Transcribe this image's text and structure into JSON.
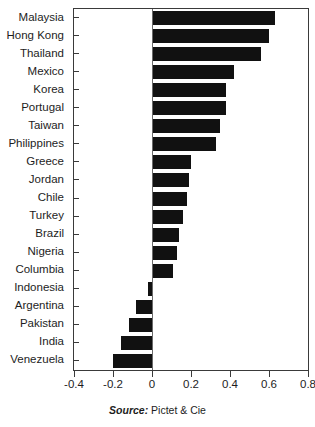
{
  "chart_data": {
    "type": "bar",
    "orientation": "horizontal",
    "title": "",
    "subtitle": "",
    "xlabel": "",
    "ylabel": "",
    "xlim": [
      -0.4,
      0.8
    ],
    "xticks": [
      -0.4,
      -0.2,
      0,
      0.2,
      0.4,
      0.6,
      0.8
    ],
    "xticklabels": [
      "-0.4",
      "-0.2",
      "0",
      "0.2",
      "0.4",
      "0.6",
      "0.8"
    ],
    "grid": false,
    "legend": null,
    "zero_line": true,
    "bar_color": "#111111",
    "categories": [
      "Malaysia",
      "Hong Kong",
      "Thailand",
      "Mexico",
      "Korea",
      "Portugal",
      "Taiwan",
      "Philippines",
      "Greece",
      "Jordan",
      "Chile",
      "Turkey",
      "Brazil",
      "Nigeria",
      "Columbia",
      "Indonesia",
      "Argentina",
      "Pakistan",
      "India",
      "Venezuela"
    ],
    "values": [
      0.63,
      0.6,
      0.56,
      0.42,
      0.38,
      0.38,
      0.35,
      0.33,
      0.2,
      0.19,
      0.18,
      0.16,
      0.14,
      0.13,
      0.11,
      -0.02,
      -0.08,
      -0.12,
      -0.16,
      -0.2
    ]
  },
  "caption": {
    "source_word": "Source:",
    "source_name": "Pictet & Cie"
  }
}
